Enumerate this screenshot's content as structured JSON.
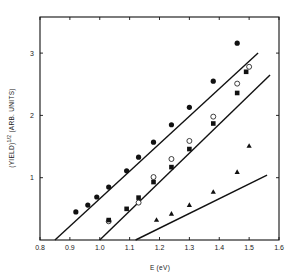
{
  "chart_data": {
    "type": "scatter",
    "title": "",
    "xlabel": "E (eV)",
    "ylabel": "(YIELD)^1/2 (ARB. UNITS)",
    "xlim": [
      0.8,
      1.6
    ],
    "ylim": [
      0,
      3.55
    ],
    "xticks": [
      "0.8",
      "0.9",
      "1.0",
      "1.1",
      "1.2",
      "1.3",
      "1.4",
      "1.5",
      "1.6"
    ],
    "yticks": [
      "1",
      "2",
      "3"
    ],
    "grid": false,
    "legend": "none",
    "series": [
      {
        "name": "filled-circles",
        "marker": "filled-circle",
        "points": [
          [
            0.92,
            0.45
          ],
          [
            0.96,
            0.56
          ],
          [
            0.99,
            0.69
          ],
          [
            1.03,
            0.85
          ],
          [
            1.09,
            1.11
          ],
          [
            1.13,
            1.33
          ],
          [
            1.18,
            1.57
          ],
          [
            1.24,
            1.85
          ],
          [
            1.3,
            2.13
          ],
          [
            1.38,
            2.55
          ],
          [
            1.46,
            3.16
          ]
        ],
        "fit_line": [
          [
            0.85,
            0.0
          ],
          [
            1.53,
            3.0
          ]
        ]
      },
      {
        "name": "open-circles",
        "marker": "open-circle",
        "points": [
          [
            1.03,
            0.3
          ],
          [
            1.13,
            0.6
          ],
          [
            1.18,
            1.01
          ],
          [
            1.24,
            1.3
          ],
          [
            1.3,
            1.59
          ],
          [
            1.38,
            1.98
          ],
          [
            1.46,
            2.51
          ],
          [
            1.5,
            2.78
          ]
        ],
        "fit_line": [
          [
            1.0,
            0.0
          ],
          [
            1.57,
            2.65
          ]
        ]
      },
      {
        "name": "filled-squares",
        "marker": "filled-square",
        "points": [
          [
            1.03,
            0.32
          ],
          [
            1.09,
            0.5
          ],
          [
            1.13,
            0.68
          ],
          [
            1.18,
            0.93
          ],
          [
            1.24,
            1.17
          ],
          [
            1.3,
            1.46
          ],
          [
            1.38,
            1.87
          ],
          [
            1.46,
            2.36
          ],
          [
            1.49,
            2.7
          ]
        ],
        "fit_line": [
          [
            1.0,
            0.0
          ],
          [
            1.57,
            2.65
          ]
        ]
      },
      {
        "name": "filled-triangles",
        "marker": "filled-triangle",
        "points": [
          [
            1.19,
            0.32
          ],
          [
            1.24,
            0.42
          ],
          [
            1.3,
            0.56
          ],
          [
            1.38,
            0.77
          ],
          [
            1.46,
            1.09
          ],
          [
            1.5,
            1.51
          ]
        ],
        "fit_line": [
          [
            1.12,
            0.0
          ],
          [
            1.56,
            1.04
          ]
        ]
      }
    ]
  },
  "labels": {
    "xlabel": "E (eV)",
    "ylabel_main": "(YIELD)",
    "ylabel_exp": "1/2",
    "ylabel_units": "(ARB. UNITS)"
  }
}
